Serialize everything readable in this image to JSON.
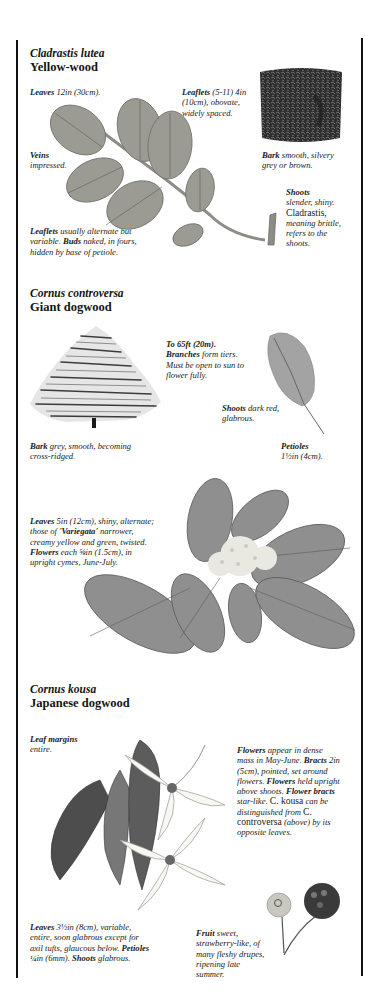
{
  "sections": [
    {
      "scientific_name": "Cladrastis lutea",
      "common_name": "Yellow-wood",
      "notes": {
        "leaves": {
          "bold": "Leaves",
          "text": " 12in (30cm)."
        },
        "leaflets_size": {
          "bold": "Leaflets",
          "text": " (5-11) 4in (10cm), obovate, widely spaced."
        },
        "veins": {
          "bold": "Veins",
          "text": "impressed."
        },
        "bark": {
          "bold": "Bark",
          "text": " smooth, silvery grey or brown."
        },
        "shoots": {
          "bold": "Shoots",
          "text": "slender, shiny.",
          "roman": "Cladrastis,",
          "text2": "meaning brittle, refers to the shoots."
        },
        "leaflets_arrangement": {
          "bold": "Leaflets",
          "text": " usually alternate but variable. ",
          "bold2": "Buds",
          "text2": " naked, in fours, hidden by base of petiole."
        }
      },
      "illustrations": [
        "leaf-branch-illustration",
        "bark-illustration"
      ]
    },
    {
      "scientific_name": "Cornus controversa",
      "common_name": "Giant dogwood",
      "notes": {
        "height": {
          "bold": "To 65ft (20m).",
          "bold2": "Branches",
          "text": " form tiers. Must be open to sun to flower fully."
        },
        "shoots": {
          "bold": "Shoots",
          "text": " dark red, glabrous."
        },
        "bark": {
          "bold": "Bark",
          "text": " grey, smooth, becoming cross-ridged."
        },
        "petioles": {
          "bold": "Petioles",
          "text": "1½in (4cm)."
        },
        "leaves": {
          "bold": "Leaves",
          "text": " 5in (12cm), shiny, alternate; those of ",
          "bold2": "'Variegata'",
          "text2": " narrower, creamy yellow and green, twisted. ",
          "bold3": "Flowers",
          "text3": " each ⅝in (1.5cm), in upright cymes, June-July."
        }
      },
      "illustrations": [
        "tree-illustration",
        "single-leaf-illustration",
        "flowering-branch-illustration"
      ]
    },
    {
      "scientific_name": "Cornus kousa",
      "common_name": "Japanese dogwood",
      "notes": {
        "leaf_margins": {
          "bold": "Leaf margins",
          "text": "entire."
        },
        "flowers": {
          "bold": "Flowers",
          "text": " appear in dense mass in May-June. ",
          "bold2": "Bracts",
          "text2": " 2in (5cm), pointed, set around flowers. ",
          "bold3": "Flowers",
          "text3": " held upright above shoots. ",
          "bold4": "Flower bracts",
          "text4": " star-like. ",
          "roman": "C. kousa",
          "text5": " can be distinguished from ",
          "roman2": "C. controversa",
          "text6": " (above) by its opposite leaves."
        },
        "leaves": {
          "bold": "Leaves",
          "text": " 3½in (8cm), variable, entire, soon glabrous except for axil tufts, glaucous below. ",
          "bold2": "Petioles",
          "text2": " ¼in (6mm). ",
          "bold3": "Shoots",
          "text3": " glabrous."
        },
        "fruit": {
          "bold": "Fruit",
          "text": " sweet, strawberry-like, of many fleshy drupes, ripening late summer."
        }
      },
      "illustrations": [
        "flower-leaf-illustration",
        "fruit-illustration"
      ]
    }
  ],
  "colors": {
    "border": "#111111",
    "text": "#141414",
    "illustration_grey": "#8a8a8a",
    "dark_grey": "#3a3a3a"
  }
}
